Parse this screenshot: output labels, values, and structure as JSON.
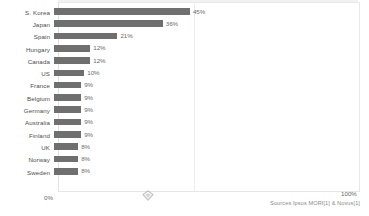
{
  "chart_data": {
    "type": "bar",
    "orientation": "horizontal",
    "title": "",
    "xlabel": "",
    "ylabel": "",
    "xlim": [
      0,
      100
    ],
    "grid": true,
    "legend": null,
    "categories": [
      "S. Korea",
      "Japan",
      "Spain",
      "Hungary",
      "Canada",
      "US",
      "France",
      "Belgium",
      "Germany",
      "Australia",
      "Finland",
      "UK",
      "Norway",
      "Sweden"
    ],
    "values": [
      45,
      36,
      21,
      12,
      12,
      10,
      9,
      9,
      9,
      9,
      9,
      8,
      8,
      8
    ],
    "value_labels": [
      "45%",
      "36%",
      "21%",
      "12%",
      "12%",
      "10%",
      "9%",
      "9%",
      "9%",
      "9%",
      "9%",
      "8%",
      "8%",
      "8%"
    ],
    "bar_color": "#6f6f6f",
    "axis_ticks": [
      "0%",
      "100%"
    ],
    "source_note": "Sources Ipsos MORI[1] & Novus[1]"
  },
  "axis": {
    "left_tick": "0%",
    "right_tick": "100%"
  },
  "footer": {
    "source": "Sources Ipsos MORI[1] & Novus[1]"
  },
  "colors": {
    "bar": "#6f6f6f",
    "frame": "#e8e8e8",
    "grid": "#ededed",
    "text": "#4d4d4d"
  },
  "icons": {
    "diamond": "diamond-marker-icon"
  }
}
